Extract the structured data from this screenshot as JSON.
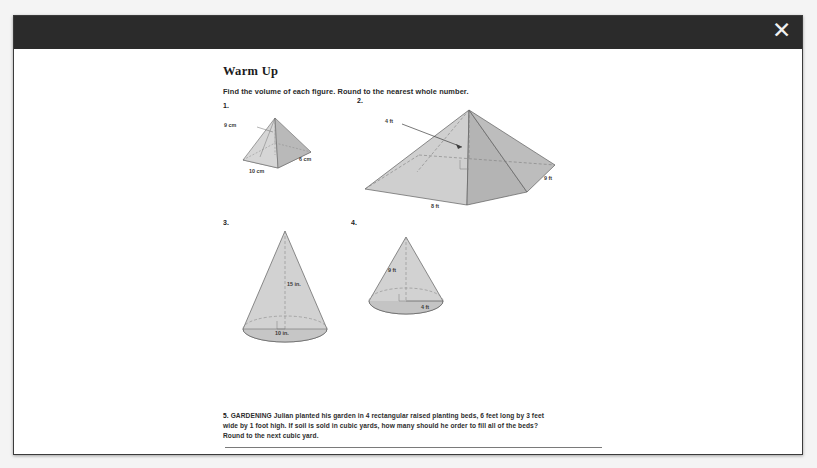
{
  "modal": {
    "close_icon": "close-icon",
    "close_label": "✕"
  },
  "worksheet": {
    "title": "Warm Up",
    "instructions": "Find the volume of each figure. Round to the nearest whole number.",
    "problems": [
      {
        "number": "1.",
        "shape": "rectangular-pyramid",
        "labels": {
          "height": "9 cm",
          "base_length": "10 cm",
          "base_width": "6 cm"
        }
      },
      {
        "number": "2.",
        "shape": "rectangular-pyramid",
        "labels": {
          "height": "4 ft",
          "base_length": "8 ft",
          "base_width": "9 ft"
        }
      },
      {
        "number": "3.",
        "shape": "cone",
        "labels": {
          "height": "15 in.",
          "diameter": "10 in."
        }
      },
      {
        "number": "4.",
        "shape": "cone",
        "labels": {
          "height": "9 ft",
          "radius": "4 ft"
        }
      }
    ],
    "problem5": {
      "number": "5.",
      "topic": "GARDENING",
      "text": "Julian planted his garden in 4 rectangular raised planting beds, 6 feet long by 3 feet wide by 1 foot high. If soil is sold in cubic yards, how many should he order to fill all of the beds? Round to the next cubic yard."
    },
    "show_answers_label": "Show Answers"
  },
  "colors": {
    "header_bar": "#2b2b2b",
    "sheet": "#ffffff",
    "figure_fill_light": "#d9d9d9",
    "figure_fill_dark": "#b6b6b6",
    "outline": "#5a5a5a",
    "button": "#3c3c3c",
    "backdrop": "#f4f4f4"
  }
}
